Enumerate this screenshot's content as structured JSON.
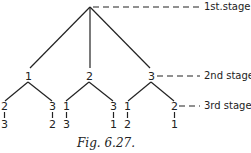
{
  "stages": {
    "first": "1st.stage",
    "second": "2nd stage",
    "third": "3rd stage"
  },
  "tree": {
    "level2": [
      "1",
      "2",
      "3"
    ],
    "level3": [
      {
        "top": "2",
        "bottom": "3"
      },
      {
        "top": "3",
        "bottom": "2"
      },
      {
        "top": "1",
        "bottom": "3"
      },
      {
        "top": "3",
        "bottom": "1"
      },
      {
        "top": "1",
        "bottom": "2"
      },
      {
        "top": "2",
        "bottom": "1"
      }
    ]
  },
  "caption": "Fig. 6.27."
}
